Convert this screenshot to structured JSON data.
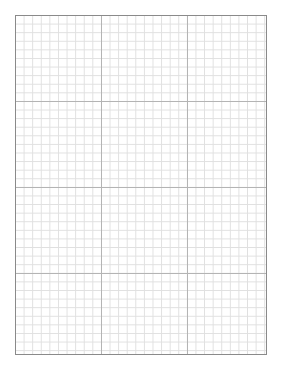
{
  "document": {
    "type": "graph-paper",
    "grid": {
      "minor_cell_px": 8.6,
      "major_every": 10,
      "columns": 29,
      "rows": 39,
      "minor_line_color": "#e0e0e0",
      "major_line_color": "#b4b4b4",
      "border_color": "#8a8a8a"
    }
  }
}
